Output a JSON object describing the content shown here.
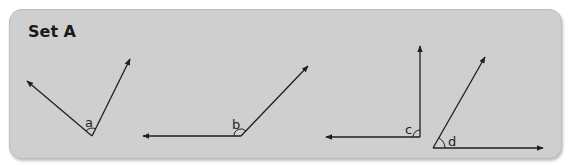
{
  "panel": {
    "title": "Set A",
    "background": "#cfcfcf",
    "stroke_color": "#1f1f1f"
  },
  "angles": [
    {
      "label": "a",
      "vertex": [
        92,
        136
      ],
      "ray1_tip": [
        27,
        81
      ],
      "ray2_tip": [
        130,
        59
      ]
    },
    {
      "label": "b",
      "vertex": [
        241,
        136
      ],
      "ray1_tip": [
        143,
        136
      ],
      "ray2_tip": [
        308,
        66
      ]
    },
    {
      "label": "c",
      "vertex": [
        420,
        137
      ],
      "ray1_tip": [
        326,
        137
      ],
      "ray2_tip": [
        420,
        46
      ]
    },
    {
      "label": "d",
      "vertex": [
        433,
        148
      ],
      "ray1_tip": [
        543,
        148
      ],
      "ray2_tip": [
        485,
        57
      ]
    }
  ]
}
